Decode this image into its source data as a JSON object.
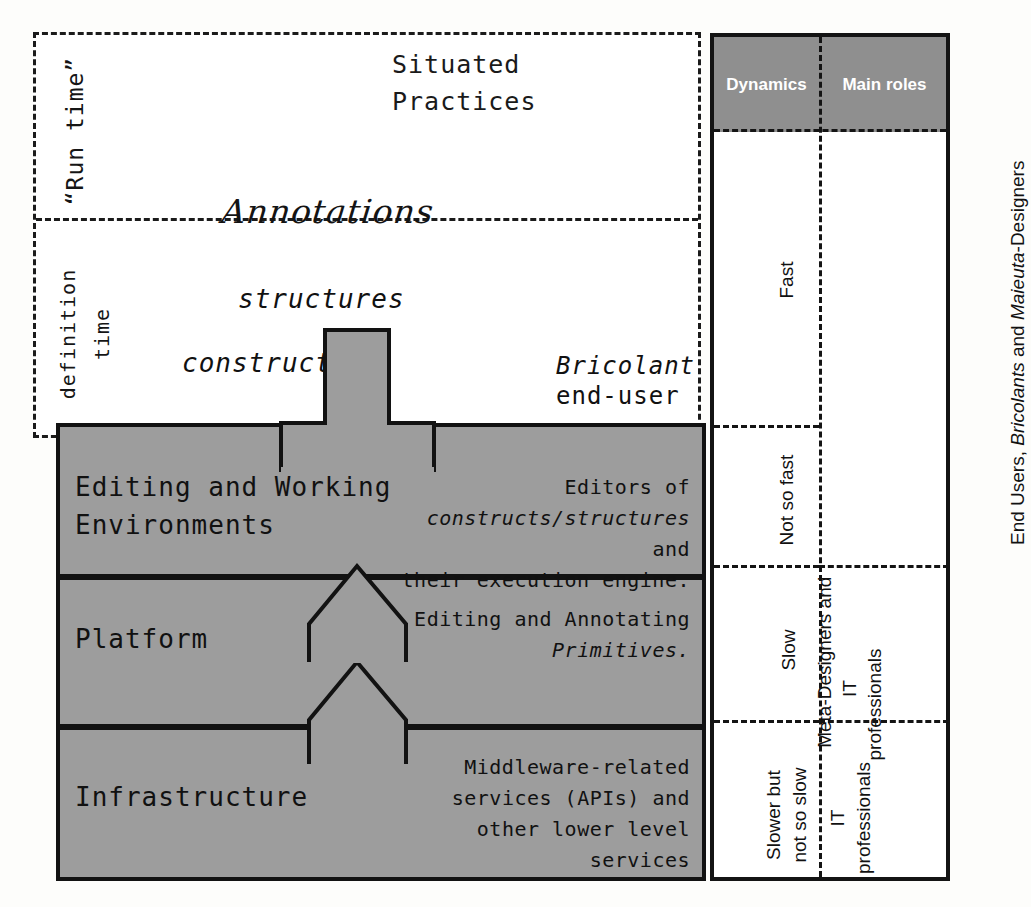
{
  "diagram": {
    "runtime_label": "“Run time”",
    "definition_time_label": "definition\ntime",
    "situated_practices": "Situated\nPractices",
    "annotations_label": "Annotations",
    "cards": {
      "structures": "structures",
      "constructs": "constructs"
    },
    "bricolant": {
      "name": "Bricolant",
      "role": "end-user"
    },
    "layers": [
      {
        "title": "Editing and Working\nEnvironments",
        "desc_line1": "Editors of",
        "desc_italic": "constructs/structures",
        "desc_line2_tail": " and",
        "desc_line3": "their execution engine."
      },
      {
        "title": "Platform",
        "desc_line1": "Editing and Annotating",
        "desc_italic": "Primitives.",
        "desc_line2_tail": "",
        "desc_line3": ""
      },
      {
        "title": "Infrastructure",
        "desc_line1": "Middleware-related",
        "desc_italic": "",
        "desc_line2_tail": "services (APIs) and",
        "desc_line3": "other lower level services"
      }
    ]
  },
  "table": {
    "headers": {
      "dynamics": "Dynamics",
      "main_roles": "Main roles"
    },
    "rows": [
      {
        "dynamics": "Fast",
        "roles": ""
      },
      {
        "dynamics": "Not so fast",
        "roles": ""
      },
      {
        "dynamics": "Slow",
        "roles": ""
      },
      {
        "dynamics": "Slower but\nnot so slow",
        "roles": "IT\nprofessionals"
      }
    ],
    "roles_groups": [
      {
        "text_plain_1": "End Users,",
        "text_italic": "Bricolants",
        "text_plain_2": " and ",
        "text_italic_2": "Maieuta",
        "text_plain_3": "-Designers"
      },
      {
        "text_plain_1": "Meta-",
        "text_italic": "",
        "text_plain_2": "Designers and",
        "text_italic_2": "",
        "text_plain_3": "IT\nprofessionals"
      }
    ]
  },
  "colors": {
    "band_gray": "#9d9d9d",
    "header_gray": "#8f8f8f",
    "outline": "#121212",
    "figure_dark": "#4a4a4a",
    "figure_mid": "#8c8c8c",
    "arrow_gray": "#8a8a8a"
  }
}
